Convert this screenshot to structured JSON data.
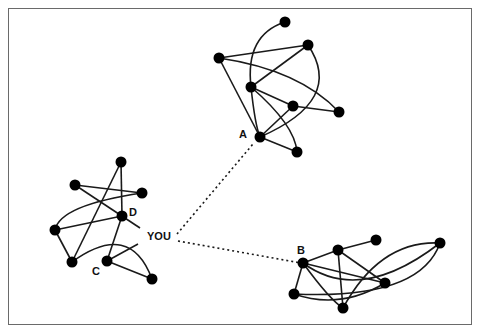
{
  "diagram": {
    "type": "social-network",
    "center_label": "YOU",
    "labels": {
      "A": "A",
      "B": "B",
      "C": "C",
      "D": "D",
      "you": "YOU"
    },
    "clusters": [
      {
        "name": "cluster-A",
        "nodes": [
          [
            285,
            22
          ],
          [
            219,
            58
          ],
          [
            308,
            45
          ],
          [
            251,
            87
          ],
          [
            293,
            106
          ],
          [
            339,
            112
          ],
          [
            260,
            137
          ],
          [
            297,
            152
          ]
        ],
        "labeled_node": "A"
      },
      {
        "name": "cluster-D",
        "nodes": [
          [
            121,
            162
          ],
          [
            75,
            185
          ],
          [
            142,
            193
          ],
          [
            122,
            216
          ],
          [
            55,
            230
          ],
          [
            72,
            262
          ],
          [
            107,
            261
          ],
          [
            152,
            279
          ]
        ],
        "labeled_nodes": [
          "D",
          "C"
        ]
      },
      {
        "name": "cluster-B",
        "nodes": [
          [
            303,
            263
          ],
          [
            338,
            250
          ],
          [
            376,
            240
          ],
          [
            440,
            243
          ],
          [
            385,
            283
          ],
          [
            294,
            294
          ],
          [
            343,
            308
          ]
        ],
        "labeled_node": "B"
      }
    ],
    "weak_ties": [
      {
        "from": "YOU",
        "to": "A",
        "style": "dotted"
      },
      {
        "from": "YOU",
        "to": "B",
        "style": "dotted"
      }
    ]
  }
}
